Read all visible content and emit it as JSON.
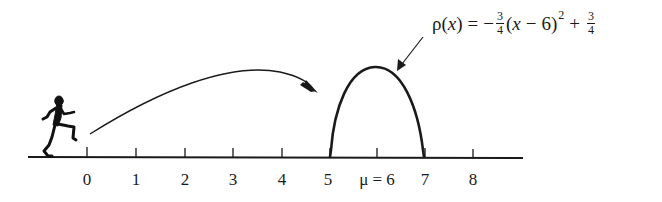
{
  "figure": {
    "equation": {
      "lhs": "ρ(",
      "lhs_var": "x",
      "lhs_close": ")",
      "equals": "=",
      "minus": "−",
      "coef_num": "3",
      "coef_den": "4",
      "paren_open": "(",
      "var": "x",
      "minus2": "−",
      "center": "6",
      "paren_close": ")",
      "exponent": "2",
      "plus": "+",
      "const_num": "3",
      "const_den": "4",
      "full_text": "ρ(x) = −3/4 (x − 6)^2 + 3/4"
    },
    "axis": {
      "ticks": [
        {
          "value": 0,
          "label": "0"
        },
        {
          "value": 1,
          "label": "1"
        },
        {
          "value": 2,
          "label": "2"
        },
        {
          "value": 3,
          "label": "3"
        },
        {
          "value": 4,
          "label": "4"
        },
        {
          "value": 5,
          "label": "5"
        },
        {
          "value": 6,
          "label": "μ = 6"
        },
        {
          "value": 7,
          "label": "7"
        },
        {
          "value": 8,
          "label": "8"
        }
      ],
      "labels": {
        "t0": "0",
        "t1": "1",
        "t2": "2",
        "t3": "3",
        "t4": "4",
        "t5": "5",
        "t6": "μ = 6",
        "t7": "7",
        "t8": "8"
      }
    },
    "colors": {
      "ink": "#1a1a1a",
      "background": "#ffffff"
    },
    "curve": {
      "type": "parabola",
      "center": 6,
      "support": [
        5,
        7
      ],
      "peak_value": 0.75
    }
  }
}
